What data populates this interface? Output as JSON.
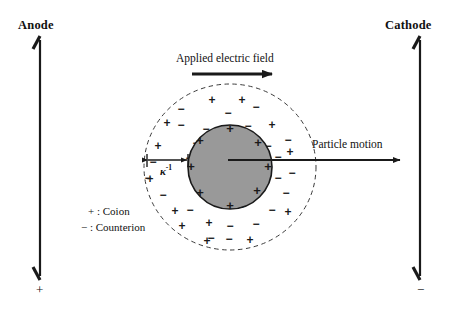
{
  "figure": {
    "background_color": "#ffffff",
    "width": 458,
    "height": 310
  },
  "electrodes": {
    "anode": {
      "label": "Anode",
      "pole_sign": "+",
      "x": 40,
      "arrow_top": 38,
      "arrow_bottom": 278
    },
    "cathode": {
      "label": "Cathode",
      "pole_sign": "−",
      "x": 420,
      "arrow_top": 38,
      "arrow_bottom": 278
    }
  },
  "annotations": {
    "field_label": "Applied electric field",
    "motion_label": "Particle motion",
    "debye_label": "κ",
    "debye_exponent": "-1"
  },
  "legend": {
    "coion": "+ : Coion",
    "counterion": "− : Counterion",
    "coion_symbol": "+",
    "counterion_symbol": "−"
  },
  "colors": {
    "particle_fill": "#999999",
    "particle_stroke": "#1a1a1a",
    "double_layer_stroke": "#444444",
    "ink": "#1a1a1a"
  },
  "geometry": {
    "center_x": 230,
    "center_y": 167,
    "particle_radius": 42,
    "debye_outer_rx": 86,
    "debye_outer_ry": 83
  },
  "chart_data": {
    "type": "diagram",
    "particle_surface_charges": [
      {
        "sign": "+",
        "x": 230,
        "y": 128
      },
      {
        "sign": "+",
        "x": 200,
        "y": 140
      },
      {
        "sign": "+",
        "x": 258,
        "y": 142
      },
      {
        "sign": "+",
        "x": 191,
        "y": 166
      },
      {
        "sign": "+",
        "x": 268,
        "y": 166
      },
      {
        "sign": "+",
        "x": 200,
        "y": 192
      },
      {
        "sign": "+",
        "x": 257,
        "y": 190
      },
      {
        "sign": "+",
        "x": 230,
        "y": 205
      }
    ],
    "diffuse_layer_ions": [
      {
        "sign": "+",
        "x": 212,
        "y": 100
      },
      {
        "sign": "+",
        "x": 242,
        "y": 100
      },
      {
        "sign": "−",
        "x": 181,
        "y": 109
      },
      {
        "sign": "−",
        "x": 228,
        "y": 113
      },
      {
        "sign": "−",
        "x": 256,
        "y": 107
      },
      {
        "sign": "+",
        "x": 167,
        "y": 123
      },
      {
        "sign": "−",
        "x": 181,
        "y": 125
      },
      {
        "sign": "−",
        "x": 206,
        "y": 129
      },
      {
        "sign": "−",
        "x": 248,
        "y": 126
      },
      {
        "sign": "+",
        "x": 272,
        "y": 125
      },
      {
        "sign": "+",
        "x": 158,
        "y": 146
      },
      {
        "sign": "−",
        "x": 196,
        "y": 143
      },
      {
        "sign": "−",
        "x": 222,
        "y": 147
      },
      {
        "sign": "−",
        "x": 268,
        "y": 146
      },
      {
        "sign": "−",
        "x": 288,
        "y": 140
      },
      {
        "sign": "−",
        "x": 153,
        "y": 162
      },
      {
        "sign": "−",
        "x": 189,
        "y": 158
      },
      {
        "sign": "+",
        "x": 290,
        "y": 152
      },
      {
        "sign": "−",
        "x": 278,
        "y": 157
      },
      {
        "sign": "−",
        "x": 148,
        "y": 178
      },
      {
        "sign": "+",
        "x": 150,
        "y": 179
      },
      {
        "sign": "−",
        "x": 195,
        "y": 183
      },
      {
        "sign": "−",
        "x": 278,
        "y": 178
      },
      {
        "sign": "−",
        "x": 292,
        "y": 173
      },
      {
        "sign": "−",
        "x": 163,
        "y": 195
      },
      {
        "sign": "−",
        "x": 208,
        "y": 200
      },
      {
        "sign": "−",
        "x": 252,
        "y": 198
      },
      {
        "sign": "−",
        "x": 286,
        "y": 193
      },
      {
        "sign": "+",
        "x": 175,
        "y": 211
      },
      {
        "sign": "−",
        "x": 190,
        "y": 210
      },
      {
        "sign": "−",
        "x": 240,
        "y": 207
      },
      {
        "sign": "−",
        "x": 272,
        "y": 210
      },
      {
        "sign": "+",
        "x": 288,
        "y": 212
      },
      {
        "sign": "+",
        "x": 182,
        "y": 226
      },
      {
        "sign": "+",
        "x": 209,
        "y": 223
      },
      {
        "sign": "−",
        "x": 230,
        "y": 226
      },
      {
        "sign": "−",
        "x": 256,
        "y": 224
      },
      {
        "sign": "−",
        "x": 211,
        "y": 238
      },
      {
        "sign": "+",
        "x": 207,
        "y": 241
      },
      {
        "sign": "−",
        "x": 229,
        "y": 239
      },
      {
        "sign": "+",
        "x": 250,
        "y": 240
      }
    ]
  }
}
